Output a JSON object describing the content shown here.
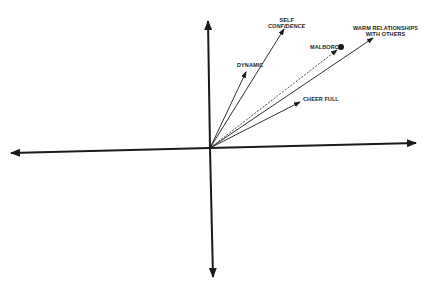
{
  "diagram": {
    "type": "perceptual-vector-map",
    "colors": {
      "ink": "#1a1a1a",
      "background": "#ffffff"
    },
    "origin": {
      "x": 210,
      "y": 148
    },
    "axes": {
      "up": {
        "x": 208,
        "y": 20
      },
      "down": {
        "x": 213,
        "y": 278
      },
      "left": {
        "x": 10,
        "y": 153
      },
      "right": {
        "x": 417,
        "y": 143
      }
    },
    "vectors": [
      {
        "id": "self-confidence",
        "label_line1": "SELF",
        "label_line2": "CONFIDENCE",
        "tip": {
          "x": 284,
          "y": 29
        },
        "style": "solid"
      },
      {
        "id": "dynamic",
        "label": "DYNAMIC",
        "tip": {
          "x": 246,
          "y": 72
        },
        "style": "solid"
      },
      {
        "id": "warm-relationships",
        "label_line1": "WARM RELATIONSHIPS",
        "label_line2": "WITH OTHERS",
        "tip": {
          "x": 373,
          "y": 38
        },
        "style": "solid"
      },
      {
        "id": "cheer-full",
        "label": "CHEER FULL",
        "tip": {
          "x": 300,
          "y": 102
        },
        "style": "solid"
      },
      {
        "id": "malboro",
        "label": "MALBORO",
        "tip": {
          "x": 337,
          "y": 50
        },
        "style": "dashed",
        "point": {
          "x": 341,
          "y": 47
        }
      }
    ]
  }
}
